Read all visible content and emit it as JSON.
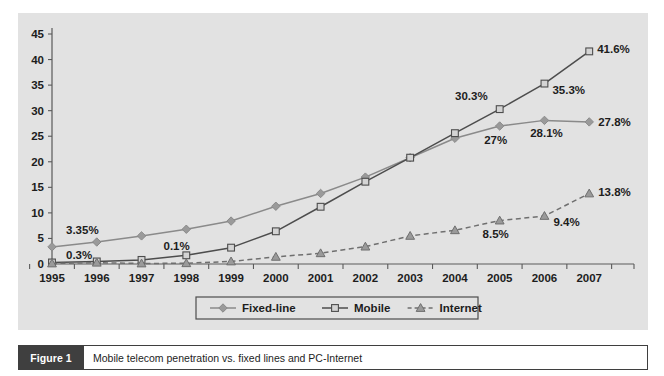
{
  "figure": {
    "tag": "Figure 1",
    "caption": "Mobile telecom penetration vs. fixed lines and PC-Internet"
  },
  "colors": {
    "panel_background": "#e2e2e2",
    "page_background": "#ffffff",
    "axis": "#5a5a5a",
    "fixed_line": "#8a8a8a",
    "mobile": "#4d4d4d",
    "internet": "#6f6f6f",
    "marker_fill": "#9a9a9a",
    "text": "#1d1d1d",
    "caption_bar": "#3f3f3f"
  },
  "chart_data": {
    "type": "line",
    "title": "",
    "subtitle": "",
    "xlabel": "",
    "ylabel": "",
    "grid": false,
    "legend_position": "bottom",
    "xlim": [
      1995,
      2008
    ],
    "ylim": [
      0,
      45
    ],
    "yticks": [
      0,
      5,
      10,
      15,
      20,
      25,
      30,
      35,
      40,
      45
    ],
    "ytick_labels": [
      "0",
      "5",
      "10",
      "15",
      "20",
      "25",
      "30",
      "35",
      "40",
      "45"
    ],
    "categories": [
      1995,
      1996,
      1997,
      1998,
      1999,
      2000,
      2001,
      2002,
      2003,
      2004,
      2005,
      2006,
      2007
    ],
    "xtick_labels": [
      "1995",
      "1996",
      "1997",
      "1998",
      "1999",
      "2000",
      "2001",
      "2002",
      "2003",
      "2004",
      "2005",
      "2006",
      "2007"
    ],
    "series": [
      {
        "name": "Fixed-line",
        "marker": "diamond",
        "linestyle": "solid",
        "color": "#8a8a8a",
        "values": [
          3.35,
          4.3,
          5.5,
          6.8,
          8.4,
          11.3,
          13.8,
          17.0,
          20.8,
          24.6,
          27.0,
          28.1,
          27.8
        ]
      },
      {
        "name": "Mobile",
        "marker": "square",
        "linestyle": "solid",
        "color": "#4d4d4d",
        "values": [
          0.3,
          0.5,
          0.8,
          1.7,
          3.2,
          6.4,
          11.2,
          16.1,
          20.8,
          25.6,
          30.3,
          35.3,
          41.6
        ]
      },
      {
        "name": "Internet",
        "marker": "triangle",
        "linestyle": "dashed",
        "color": "#6f6f6f",
        "values": [
          0.1,
          0.25,
          0.1,
          0.15,
          0.5,
          1.4,
          2.1,
          3.4,
          5.5,
          6.6,
          8.5,
          9.4,
          13.8
        ]
      }
    ],
    "annotations": [
      {
        "text": "3.35%",
        "series": "Fixed-line",
        "x": 1995,
        "y": 3.35,
        "dx": 14,
        "dy": -13,
        "anchor": "start"
      },
      {
        "text": "0.3%",
        "series": "Mobile",
        "x": 1995,
        "y": 0.3,
        "dx": 14,
        "dy": -3,
        "anchor": "start"
      },
      {
        "text": "0.1%",
        "series": "Internet",
        "x": 1997,
        "y": 0.1,
        "dx": 22,
        "dy": -13,
        "anchor": "start"
      },
      {
        "text": "30.3%",
        "series": "Mobile",
        "x": 2005,
        "y": 30.3,
        "dx": -12,
        "dy": -9,
        "anchor": "end"
      },
      {
        "text": "35.3%",
        "series": "Mobile",
        "x": 2006,
        "y": 35.3,
        "dx": 8,
        "dy": 10,
        "anchor": "start"
      },
      {
        "text": "41.6%",
        "series": "Mobile",
        "x": 2007,
        "y": 41.6,
        "dx": 8,
        "dy": 2,
        "anchor": "start"
      },
      {
        "text": "27%",
        "series": "Fixed-line",
        "x": 2005,
        "y": 27.0,
        "dx": -4,
        "dy": 18,
        "anchor": "middle"
      },
      {
        "text": "28.1%",
        "series": "Fixed-line",
        "x": 2006,
        "y": 28.1,
        "dx": 2,
        "dy": 17,
        "anchor": "middle"
      },
      {
        "text": "27.8%",
        "series": "Fixed-line",
        "x": 2007,
        "y": 27.8,
        "dx": 9,
        "dy": 4,
        "anchor": "start"
      },
      {
        "text": "8.5%",
        "series": "Internet",
        "x": 2005,
        "y": 8.5,
        "dx": -4,
        "dy": 17,
        "anchor": "middle"
      },
      {
        "text": "9.4%",
        "series": "Internet",
        "x": 2006,
        "y": 9.4,
        "dx": 9,
        "dy": 10,
        "anchor": "start"
      },
      {
        "text": "13.8%",
        "series": "Internet",
        "x": 2007,
        "y": 13.8,
        "dx": 9,
        "dy": 3,
        "anchor": "start"
      }
    ],
    "legend": [
      {
        "label": "Fixed-line",
        "marker": "diamond",
        "linestyle": "solid",
        "color": "#8a8a8a"
      },
      {
        "label": "Mobile",
        "marker": "square",
        "linestyle": "solid",
        "color": "#4d4d4d"
      },
      {
        "label": "Internet",
        "marker": "triangle",
        "linestyle": "dashed",
        "color": "#6f6f6f"
      }
    ]
  }
}
